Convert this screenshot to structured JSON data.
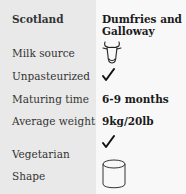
{
  "header": {
    "region": "Scotland",
    "area": "Dumfries and Galloway",
    "area_line1": "Dumfries and",
    "area_line2": "Galloway"
  },
  "rows": [
    {
      "label": "Milk source",
      "value_icon": "cow-icon"
    },
    {
      "label": "Unpasteurized",
      "value_icon": "checkmark-icon"
    },
    {
      "label": "Maturing time",
      "value": "6-9 months"
    },
    {
      "label": "Average weight",
      "value": "9kg/20lb"
    },
    {
      "label": "Vegetarian",
      "value_icon": "checkmark-icon"
    },
    {
      "label": "Shape",
      "value_icon": "cylinder-icon"
    }
  ]
}
